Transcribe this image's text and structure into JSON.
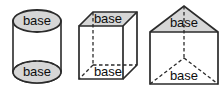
{
  "figure_set": {
    "title": "Solids labeled with their bases",
    "background_color": "#ffffff",
    "outline_color": "#2b2b2b",
    "base_fill_color": "#d6d6d6",
    "body_fill_color": "#ffffff",
    "label_text_color": "#0d0d0d",
    "figures": [
      {
        "id": "cylinder",
        "name": "cylinder",
        "top_base_label": "base",
        "bottom_base_label": "base",
        "hidden_edge_style": "dashed"
      },
      {
        "id": "rectangular-prism",
        "name": "rectangular prism",
        "top_base_label": "base",
        "bottom_base_label": "base",
        "hidden_edge_style": "dashed"
      },
      {
        "id": "triangular-prism",
        "name": "triangular prism",
        "top_base_label": "base",
        "bottom_base_label": "base",
        "hidden_edge_style": "dashed"
      }
    ]
  }
}
